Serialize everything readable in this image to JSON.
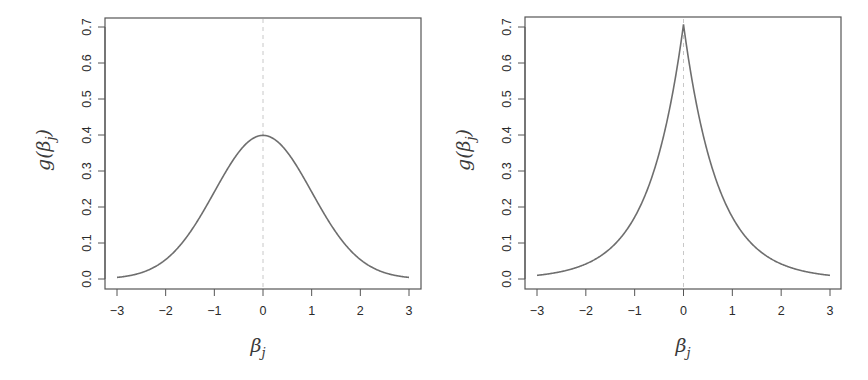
{
  "chart_data": [
    {
      "type": "line",
      "title": "",
      "panel": "left",
      "distribution": "gaussian",
      "params": {
        "mean": 0,
        "sd": 1
      },
      "xlabel": "β_j",
      "ylabel": "g(β_j)",
      "xlim": [
        -3,
        3
      ],
      "ylim": [
        0,
        0.7
      ],
      "xticks": [
        -3,
        -2,
        -1,
        0,
        1,
        2,
        3
      ],
      "xtick_labels": [
        "−3",
        "−2",
        "−1",
        "0",
        "1",
        "2",
        "3"
      ],
      "yticks": [
        0.0,
        0.1,
        0.2,
        0.3,
        0.4,
        0.5,
        0.6,
        0.7
      ],
      "ytick_labels": [
        "0.0",
        "0.1",
        "0.2",
        "0.3",
        "0.4",
        "0.5",
        "0.6",
        "0.7"
      ],
      "grid": false,
      "legend": null,
      "reference_line": {
        "x": 0,
        "style": "dashed",
        "color": "#c8c8c8"
      },
      "series": [
        {
          "name": "Gaussian density",
          "color": "#6e6e6e",
          "x": [
            -3,
            -2.5,
            -2,
            -1.5,
            -1,
            -0.5,
            0,
            0.5,
            1,
            1.5,
            2,
            2.5,
            3
          ],
          "values": [
            0.004,
            0.018,
            0.054,
            0.13,
            0.242,
            0.352,
            0.399,
            0.352,
            0.242,
            0.13,
            0.054,
            0.018,
            0.004
          ]
        }
      ]
    },
    {
      "type": "line",
      "title": "",
      "panel": "right",
      "distribution": "laplace",
      "params": {
        "location": 0,
        "scale": 0.7071
      },
      "xlabel": "β_j",
      "ylabel": "g(β_j)",
      "xlim": [
        -3,
        3
      ],
      "ylim": [
        0,
        0.7
      ],
      "xticks": [
        -3,
        -2,
        -1,
        0,
        1,
        2,
        3
      ],
      "xtick_labels": [
        "−3",
        "−2",
        "−1",
        "0",
        "1",
        "2",
        "3"
      ],
      "yticks": [
        0.0,
        0.1,
        0.2,
        0.3,
        0.4,
        0.5,
        0.6,
        0.7
      ],
      "ytick_labels": [
        "0.0",
        "0.1",
        "0.2",
        "0.3",
        "0.4",
        "0.5",
        "0.6",
        "0.7"
      ],
      "grid": false,
      "legend": null,
      "reference_line": {
        "x": 0,
        "style": "dashed",
        "color": "#c8c8c8"
      },
      "series": [
        {
          "name": "Laplace density",
          "color": "#6e6e6e",
          "x": [
            -3,
            -2.5,
            -2,
            -1.5,
            -1,
            -0.5,
            0,
            0.5,
            1,
            1.5,
            2,
            2.5,
            3
          ],
          "values": [
            0.01,
            0.03,
            0.042,
            0.084,
            0.172,
            0.348,
            0.707,
            0.348,
            0.172,
            0.084,
            0.042,
            0.03,
            0.01
          ]
        }
      ]
    }
  ],
  "panels": [
    {
      "ylabel_main": "g(β",
      "ylabel_sub": "j",
      "ylabel_close": ")",
      "xlabel_main": "β",
      "xlabel_sub": "j"
    },
    {
      "ylabel_main": "g(β",
      "ylabel_sub": "j",
      "ylabel_close": ")",
      "xlabel_main": "β",
      "xlabel_sub": "j"
    }
  ]
}
